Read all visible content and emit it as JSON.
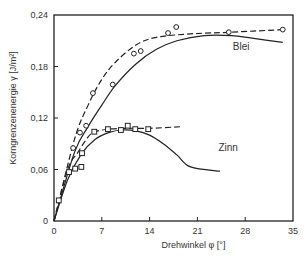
{
  "chart_data": {
    "type": "scatter",
    "title": "",
    "xlabel": "Drehwinkel φ [°]",
    "ylabel": "Korngrenzenenergie γ [J/m²]",
    "xlim": [
      0,
      35
    ],
    "ylim": [
      0,
      0.24
    ],
    "x_ticks": [
      0,
      7,
      14,
      21,
      28,
      35
    ],
    "x_tick_labels": [
      "0",
      "7",
      "14",
      "21",
      "28",
      "35"
    ],
    "y_ticks": [
      0,
      0.06,
      0.12,
      0.18,
      0.24
    ],
    "y_tick_labels": [
      "0",
      "0,06",
      "0,12",
      "0,18",
      "0,24"
    ],
    "grid": false,
    "series": [
      {
        "name": "Blei",
        "marker": "circle",
        "points": [
          [
            2.8,
            0.085
          ],
          [
            3.8,
            0.103
          ],
          [
            4.7,
            0.111
          ],
          [
            5.7,
            0.149
          ],
          [
            8.6,
            0.159
          ],
          [
            11.7,
            0.195
          ],
          [
            12.7,
            0.198
          ],
          [
            16.7,
            0.219
          ],
          [
            17.9,
            0.226
          ],
          [
            25.6,
            0.22
          ],
          [
            33.5,
            0.223
          ]
        ],
        "dashed_fit": [
          [
            0,
            0
          ],
          [
            3,
            0.095
          ],
          [
            5,
            0.135
          ],
          [
            7,
            0.165
          ],
          [
            9,
            0.185
          ],
          [
            12,
            0.205
          ],
          [
            15,
            0.214
          ],
          [
            20,
            0.218
          ],
          [
            26,
            0.22
          ],
          [
            33.5,
            0.223
          ]
        ],
        "solid_fit": [
          [
            0,
            0
          ],
          [
            3,
            0.08
          ],
          [
            5,
            0.11
          ],
          [
            7,
            0.135
          ],
          [
            9,
            0.158
          ],
          [
            12,
            0.183
          ],
          [
            15,
            0.2
          ],
          [
            18,
            0.21
          ],
          [
            22,
            0.216
          ],
          [
            26,
            0.216
          ],
          [
            29,
            0.213
          ],
          [
            33.5,
            0.208
          ]
        ]
      },
      {
        "name": "Zinn",
        "marker": "square",
        "points": [
          [
            0.7,
            0.024
          ],
          [
            2.2,
            0.057
          ],
          [
            3.1,
            0.061
          ],
          [
            4.0,
            0.063
          ],
          [
            4.1,
            0.079
          ],
          [
            5.9,
            0.104
          ],
          [
            7.9,
            0.107
          ],
          [
            9.8,
            0.106
          ],
          [
            10.8,
            0.111
          ],
          [
            11.9,
            0.107
          ],
          [
            13.8,
            0.107
          ]
        ],
        "dashed_fit": [
          [
            0,
            0
          ],
          [
            2,
            0.06
          ],
          [
            3.5,
            0.08
          ],
          [
            5,
            0.098
          ],
          [
            6,
            0.104
          ],
          [
            8,
            0.107
          ],
          [
            11,
            0.108
          ],
          [
            14,
            0.108
          ],
          [
            18.9,
            0.11
          ]
        ],
        "solid_fit": [
          [
            0,
            0
          ],
          [
            2,
            0.048
          ],
          [
            4,
            0.078
          ],
          [
            6,
            0.095
          ],
          [
            8,
            0.103
          ],
          [
            10,
            0.106
          ],
          [
            12,
            0.105
          ],
          [
            14,
            0.1
          ],
          [
            16,
            0.09
          ],
          [
            18,
            0.077
          ],
          [
            20,
            0.063
          ],
          [
            24.3,
            0.058
          ]
        ]
      }
    ],
    "annotations": [
      {
        "text": "Blei",
        "x": 27.4,
        "y": 0.199
      },
      {
        "text": "Zinn",
        "x": 25.5,
        "y": 0.081
      }
    ],
    "legend": "none"
  }
}
